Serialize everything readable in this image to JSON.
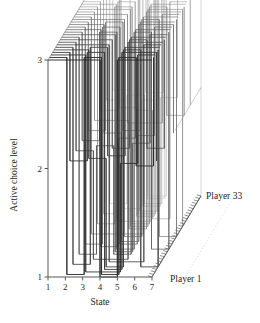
{
  "figure": {
    "width": 260,
    "height": 323,
    "background": "#ffffff"
  },
  "axes": {
    "y_axis": {
      "title": "Active choice level",
      "ticks": [
        "1",
        "2",
        "3"
      ],
      "values": [
        1,
        2,
        3
      ],
      "min": 1,
      "max": 3
    },
    "x_axis": {
      "title": "State",
      "ticks": [
        "1",
        "2",
        "3",
        "4",
        "5",
        "6",
        "7"
      ],
      "values": [
        1,
        2,
        3,
        4,
        5,
        6,
        7
      ],
      "min": 1,
      "max": 7
    },
    "z_axis": {
      "start_label": "Player 1",
      "end_label": "Player 33",
      "n_ticks": 33,
      "min": 1,
      "max": 33
    }
  },
  "colors": {
    "axis": "#58595b",
    "line_front": "#2b2b2b",
    "line_back": "#b9b9b9",
    "text": "#231f20",
    "dotted_guide": "#cfcfcf"
  },
  "chart_data": {
    "type": "line",
    "title": "",
    "xlabel": "State",
    "ylabel": "Active choice level",
    "zlabel": "Player",
    "xlim": [
      1,
      7
    ],
    "ylim": [
      1,
      3
    ],
    "zlim": [
      1,
      33
    ],
    "grid": false,
    "legend": "none",
    "x": [
      1,
      2,
      3,
      4,
      5,
      6,
      7
    ],
    "series": [
      {
        "name": "Player 1",
        "values": [
          3,
          3,
          3,
          1,
          3,
          3,
          3
        ]
      },
      {
        "name": "Player 2",
        "values": [
          3,
          1,
          3,
          1,
          3,
          2,
          3
        ]
      },
      {
        "name": "Player 3",
        "values": [
          3,
          3,
          1,
          1,
          2,
          3,
          3
        ]
      },
      {
        "name": "Player 4",
        "values": [
          3,
          2,
          3,
          1,
          3,
          3,
          2
        ]
      },
      {
        "name": "Player 5",
        "values": [
          3,
          3,
          2,
          1,
          3,
          1,
          3
        ]
      },
      {
        "name": "Player 6",
        "values": [
          3,
          1,
          3,
          2,
          3,
          3,
          3
        ]
      },
      {
        "name": "Player 7",
        "values": [
          3,
          3,
          3,
          1,
          1,
          3,
          3
        ]
      },
      {
        "name": "Player 8",
        "values": [
          3,
          2,
          1,
          1,
          3,
          3,
          3
        ]
      },
      {
        "name": "Player 9",
        "values": [
          3,
          3,
          3,
          2,
          3,
          2,
          3
        ]
      },
      {
        "name": "Player 10",
        "values": [
          3,
          1,
          2,
          1,
          3,
          3,
          3
        ]
      },
      {
        "name": "Player 11",
        "values": [
          3,
          3,
          3,
          1,
          2,
          3,
          3
        ]
      },
      {
        "name": "Player 12",
        "values": [
          3,
          2,
          3,
          1,
          3,
          1,
          3
        ]
      },
      {
        "name": "Player 13",
        "values": [
          3,
          3,
          1,
          2,
          3,
          3,
          3
        ]
      },
      {
        "name": "Player 14",
        "values": [
          3,
          1,
          3,
          1,
          2,
          3,
          3
        ]
      },
      {
        "name": "Player 15",
        "values": [
          3,
          3,
          2,
          1,
          3,
          3,
          2
        ]
      },
      {
        "name": "Player 16",
        "values": [
          3,
          2,
          3,
          2,
          3,
          3,
          3
        ]
      },
      {
        "name": "Player 17",
        "values": [
          3,
          3,
          3,
          1,
          3,
          1,
          3
        ]
      },
      {
        "name": "Player 18",
        "values": [
          3,
          1,
          1,
          1,
          3,
          3,
          3
        ]
      },
      {
        "name": "Player 19",
        "values": [
          3,
          3,
          3,
          2,
          2,
          3,
          3
        ]
      },
      {
        "name": "Player 20",
        "values": [
          3,
          2,
          2,
          1,
          3,
          3,
          3
        ]
      },
      {
        "name": "Player 21",
        "values": [
          3,
          3,
          3,
          1,
          3,
          3,
          1
        ]
      },
      {
        "name": "Player 22",
        "values": [
          3,
          1,
          3,
          1,
          3,
          2,
          3
        ]
      },
      {
        "name": "Player 23",
        "values": [
          3,
          3,
          1,
          1,
          3,
          3,
          3
        ]
      },
      {
        "name": "Player 24",
        "values": [
          3,
          2,
          3,
          2,
          1,
          3,
          3
        ]
      },
      {
        "name": "Player 25",
        "values": [
          3,
          3,
          2,
          1,
          3,
          3,
          3
        ]
      },
      {
        "name": "Player 26",
        "values": [
          3,
          1,
          3,
          1,
          3,
          3,
          2
        ]
      },
      {
        "name": "Player 27",
        "values": [
          3,
          3,
          3,
          1,
          3,
          3,
          3
        ]
      },
      {
        "name": "Player 28",
        "values": [
          3,
          2,
          1,
          2,
          3,
          3,
          3
        ]
      },
      {
        "name": "Player 29",
        "values": [
          3,
          3,
          3,
          1,
          2,
          3,
          3
        ]
      },
      {
        "name": "Player 30",
        "values": [
          3,
          1,
          2,
          1,
          3,
          3,
          3
        ]
      },
      {
        "name": "Player 31",
        "values": [
          3,
          3,
          3,
          2,
          3,
          3,
          3
        ]
      },
      {
        "name": "Player 32",
        "values": [
          3,
          2,
          3,
          1,
          3,
          3,
          3
        ]
      },
      {
        "name": "Player 33",
        "values": [
          3,
          3,
          3,
          1,
          3,
          3,
          3
        ]
      }
    ]
  }
}
